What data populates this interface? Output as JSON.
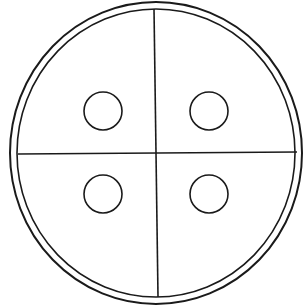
{
  "diagram": {
    "type": "circle-quadrants",
    "stroke_color": "#1a1a1a",
    "background": "#ffffff",
    "outer_ring": {
      "cx": 156,
      "cy": 153,
      "rx": 146,
      "ry": 151
    },
    "inner_ring": {
      "cx": 156,
      "cy": 153,
      "rx": 139,
      "ry": 144
    },
    "divider_vertical": {
      "x1": 154,
      "y1": 9,
      "x2": 158,
      "y2": 297
    },
    "divider_horizontal": {
      "x1": 18,
      "y1": 154,
      "x2": 297,
      "y2": 152
    },
    "quadrant_circles": [
      {
        "name": "top-left",
        "cx": 103,
        "cy": 111,
        "r": 19
      },
      {
        "name": "top-right",
        "cx": 209,
        "cy": 111,
        "r": 19
      },
      {
        "name": "bottom-left",
        "cx": 103,
        "cy": 194,
        "r": 19
      },
      {
        "name": "bottom-right",
        "cx": 209,
        "cy": 194,
        "r": 19
      }
    ]
  }
}
